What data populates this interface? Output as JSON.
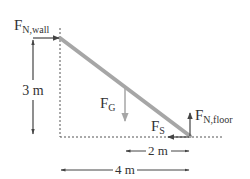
{
  "diagram": {
    "type": "free-body diagram",
    "colors": {
      "ladder": "#a6a6a6",
      "arrows": "#444444",
      "gravity_arrow": "#a6a6a6",
      "text": "#333333",
      "dotted_lines": "#555555"
    },
    "forces": [
      {
        "id": "normal-wall",
        "symbol": "F",
        "subscript": "N,wall",
        "direction": "right",
        "location": "top of ladder"
      },
      {
        "id": "gravity",
        "symbol": "F",
        "subscript": "G",
        "direction": "down",
        "location": "middle of ladder"
      },
      {
        "id": "friction",
        "symbol": "F",
        "subscript": "S",
        "direction": "left",
        "location": "bottom of ladder"
      },
      {
        "id": "normal-floor",
        "symbol": "F",
        "subscript": "N,floor",
        "direction": "up",
        "location": "bottom of ladder"
      }
    ],
    "dimensions": {
      "height": "3 m",
      "half_width": "2 m",
      "width": "4 m"
    }
  }
}
